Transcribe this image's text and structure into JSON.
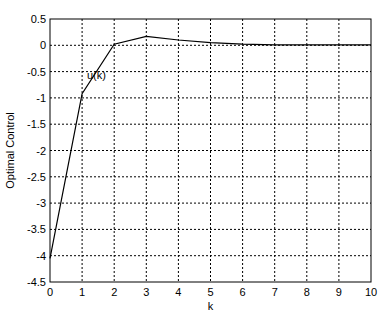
{
  "chart_data": {
    "type": "line",
    "title": "",
    "xlabel": "k",
    "ylabel": "Optimal Control",
    "xlim": [
      0,
      10
    ],
    "ylim": [
      -4.5,
      0.5
    ],
    "grid": true,
    "grid_style": "dotted",
    "x_ticks": [
      "0",
      "1",
      "2",
      "3",
      "4",
      "5",
      "6",
      "7",
      "8",
      "9",
      "10"
    ],
    "y_ticks": [
      "0.5",
      "0",
      "-0.5",
      "-1",
      "-1.5",
      "-2",
      "-2.5",
      "-3",
      "-3.5",
      "-4",
      "-4.5"
    ],
    "series": [
      {
        "name": "u(k)",
        "x": [
          0,
          1,
          2,
          3,
          4,
          5,
          6,
          7,
          8,
          9,
          10
        ],
        "values": [
          -4.05,
          -0.92,
          0.02,
          0.17,
          0.1,
          0.05,
          0.02,
          0.01,
          0.01,
          0.01,
          0.01
        ],
        "color": "#000000"
      }
    ],
    "annotations": [
      {
        "text": "u(k)",
        "x": 1.15,
        "y": -0.65
      }
    ]
  }
}
